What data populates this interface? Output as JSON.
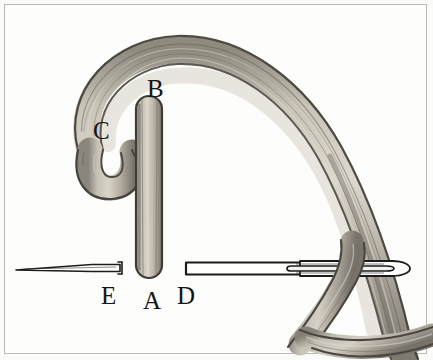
{
  "figure": {
    "type": "line-illustration",
    "background_color": "#fbfbf9",
    "frame_color": "#b9b9b9",
    "canvas": {
      "width": 433,
      "height": 360
    },
    "labels": [
      {
        "id": "A",
        "text": "A",
        "x": 143,
        "y": 288,
        "refers_to": "lower-end-of-vertical-thread"
      },
      {
        "id": "B",
        "text": "B",
        "x": 147,
        "y": 76,
        "refers_to": "upper-end-of-vertical-thread"
      },
      {
        "id": "C",
        "text": "C",
        "x": 93,
        "y": 118,
        "refers_to": "free-hooked-end-of-thread"
      },
      {
        "id": "D",
        "text": "D",
        "x": 177,
        "y": 283,
        "refers_to": "needle-shaft-near-point"
      },
      {
        "id": "E",
        "text": "E",
        "x": 101,
        "y": 283,
        "refers_to": "needle-point-segment"
      }
    ],
    "parts": {
      "thread_loop": {
        "name": "curved-thread-loop",
        "stroke_color": "#4a4640",
        "fill_color": "#b3ada2",
        "highlight_color": "#d6d1c6",
        "shadow_color": "#8b857a"
      },
      "vertical_thread": {
        "name": "vertical-thread-segment",
        "from_label": "A",
        "to_label": "B",
        "stroke_color": "#3f3b36",
        "fill_color": "#b0aa9f"
      },
      "needle": {
        "name": "sewing-needle",
        "stroke_color": "#1a1a1a",
        "fill_color": "#ffffff",
        "eye_shape": "elongated-oval",
        "point_side": "left"
      }
    }
  }
}
